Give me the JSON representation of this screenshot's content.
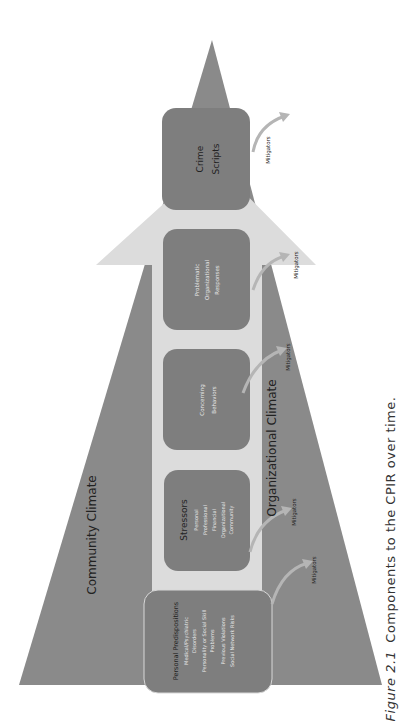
{
  "diagram": {
    "colors": {
      "background": "#ffffff",
      "community_climate_fill": "#8a8a8a",
      "arrow_shaft_fill": "#dcdcdc",
      "box_fill": "#7e7e7e",
      "box_text": "#e8e8e8",
      "label_text": "#222222",
      "mitigator_arrow": "#9a9a9a"
    },
    "community_climate_label": "Community Climate",
    "organizational_climate_label": "Organizational Climate",
    "boxes": [
      {
        "title": "Personal Predispositions",
        "lines": [
          "Medical/Psychiatric",
          "Disorders",
          "Personality or Social Skill",
          "Problems",
          "Previous Violations",
          "Social Network Risks"
        ]
      },
      {
        "title": "Stressors",
        "lines": [
          "Personal",
          "Professional",
          "Financial",
          "Organizational",
          "Community"
        ]
      },
      {
        "title": "",
        "lines": [
          "Concerning",
          "Behaviors"
        ]
      },
      {
        "title": "",
        "lines": [
          "Problematic",
          "Organizational",
          "Responses"
        ]
      },
      {
        "title": "",
        "lines": [
          "Crime",
          "Scripts"
        ]
      }
    ],
    "mitigators": [
      "Mitigators",
      "Mitigators",
      "Mitigators",
      "Mitigators",
      "Mitigators"
    ]
  },
  "caption": {
    "figure_label": "Figure 2.1",
    "text": "Components to the CPIR over time."
  }
}
